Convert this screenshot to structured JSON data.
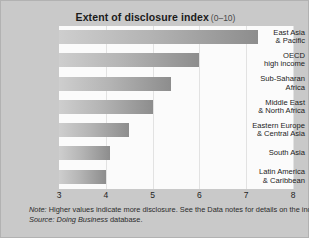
{
  "chart_data": {
    "type": "bar",
    "orientation": "horizontal",
    "title": "Extent of disclosure index",
    "title_range": "(0–10)",
    "xlabel": "",
    "ylabel": "",
    "xlim": [
      3,
      8
    ],
    "xticks": [
      "3",
      "4",
      "5",
      "6",
      "7",
      "8"
    ],
    "grid": true,
    "legend": "none",
    "categories": [
      "East Asia & Pacific",
      "OECD high income",
      "Sub-Saharan Africa",
      "Middle East & North Africa",
      "Eastern Europe & Central Asia",
      "South Asia",
      "Latin America & Caribbean"
    ],
    "category_lines": [
      [
        "East Asia",
        "& Pacific"
      ],
      [
        "OECD",
        "high income"
      ],
      [
        "Sub-Saharan",
        "Africa"
      ],
      [
        "Middle East",
        "& North Africa"
      ],
      [
        "Eastern Europe",
        "& Central Asia"
      ],
      [
        "South Asia"
      ],
      [
        "Latin America",
        "& Caribbean"
      ]
    ],
    "values": [
      7.25,
      6.0,
      5.4,
      5.0,
      4.5,
      4.1,
      4.0
    ]
  },
  "footnotes": {
    "note_label": "Note:",
    "note_text": "Higher values indicate more disclosure. See the Data notes for details on the index.",
    "source_label": "Source:",
    "source_em": "Doing Business",
    "source_text": "database."
  },
  "colors": {
    "background": "#c9c9c9",
    "panel": "#fbfbfb",
    "bar_light": "#cecece",
    "bar_dark": "#8d8d8d",
    "gridline": "#e2e2e2",
    "text": "#1b1b1b"
  }
}
